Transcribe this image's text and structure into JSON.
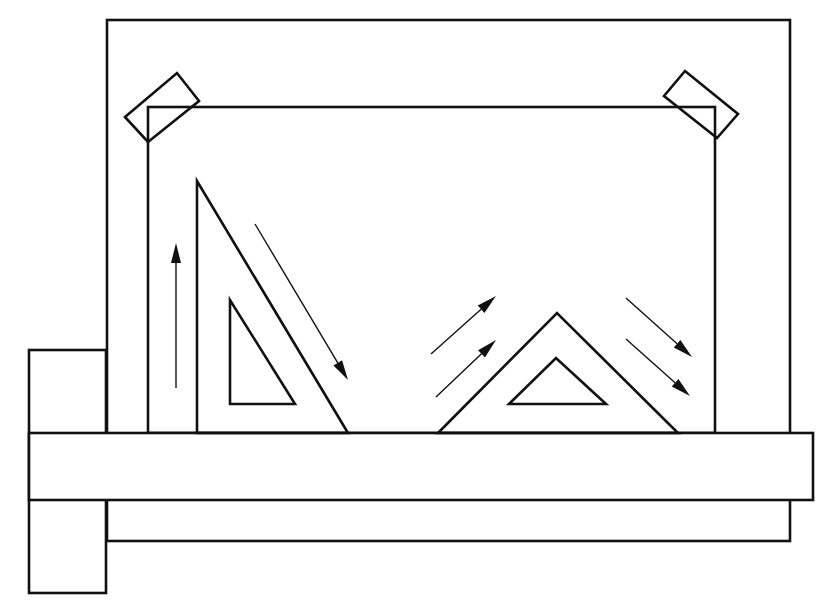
{
  "diagram": {
    "title": "",
    "stroke_color": "#111111",
    "background": "#ffffff",
    "components": [
      {
        "name": "drawing-board",
        "shape": "rect",
        "x": 107,
        "y": 20,
        "w": 683,
        "h": 521
      },
      {
        "name": "paper-sheet",
        "shape": "rect",
        "x": 148,
        "y": 107,
        "w": 567,
        "h": 326
      },
      {
        "name": "tape-top-left",
        "shape": "polygon",
        "points": "125,117 177,73 199,101 148,142"
      },
      {
        "name": "tape-top-right",
        "shape": "polygon",
        "points": "664,96 685,71 738,114 717,138"
      },
      {
        "name": "t-square-head",
        "shape": "rect",
        "x": 29,
        "y": 350,
        "w": 77,
        "h": 243
      },
      {
        "name": "t-square-blade",
        "shape": "rect",
        "x": 29,
        "y": 433,
        "w": 784,
        "h": 67
      },
      {
        "name": "set-square-30-60",
        "shape": "polygon",
        "points": "197,181 197,433 348,433",
        "inner": "230,300 230,404 295,404"
      },
      {
        "name": "set-square-45",
        "shape": "polygon",
        "points": "438,433 557,313 678,433",
        "inner": "509,404 556,358 606,404"
      }
    ],
    "arrows": [
      {
        "name": "arrow-up",
        "x1": 176,
        "y1": 388,
        "x2": 176,
        "y2": 243
      },
      {
        "name": "arrow-down-diagonal",
        "x1": 255,
        "y1": 224,
        "x2": 348,
        "y2": 380
      },
      {
        "name": "arrow-up-right-1",
        "x1": 431,
        "y1": 354,
        "x2": 496,
        "y2": 296
      },
      {
        "name": "arrow-up-right-2",
        "x1": 436,
        "y1": 397,
        "x2": 496,
        "y2": 340
      },
      {
        "name": "arrow-down-right-1",
        "x1": 626,
        "y1": 298,
        "x2": 692,
        "y2": 357
      },
      {
        "name": "arrow-down-right-2",
        "x1": 626,
        "y1": 339,
        "x2": 690,
        "y2": 396
      }
    ]
  }
}
